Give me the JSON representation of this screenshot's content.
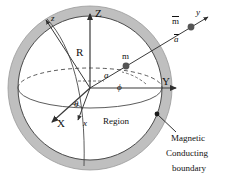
{
  "figure": {
    "type": "physics-diagram",
    "colors": {
      "boundary_ring": "#b9b9b9",
      "ring_edge": "#8d8d8d",
      "stroke": "#3a3a3a",
      "text": "#111111",
      "background": "#ffffff",
      "point_marker": "#555555"
    }
  },
  "labels": {
    "axis_Z": "Z",
    "axis_Y": "Y",
    "axis_X": "X",
    "axis_z_small": "z",
    "axis_y_small": "y",
    "axis_x_small": "x",
    "radius": "R",
    "dipole_inner": "m",
    "distance_a": "a",
    "dipole_outer": "m",
    "vector_a": "a",
    "angle_phi": "ϕ",
    "angle_theta": "θ",
    "region": "Region",
    "boundary_line1": "Magnetic",
    "boundary_line2": "Conducting",
    "boundary_line3": "boundary"
  }
}
